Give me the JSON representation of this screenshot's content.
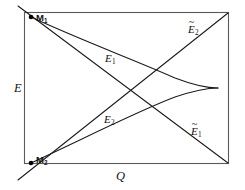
{
  "figure": {
    "kind": "phase-diagram",
    "background_color": "#ffffff",
    "ink_color": "#1a1a1a",
    "frame_color": "#5a5a5a"
  },
  "axes": {
    "y_label": "E",
    "x_label": "Q"
  },
  "nodes": [
    {
      "id": "m1",
      "label_text": "M",
      "label_sub": "1"
    },
    {
      "id": "m2",
      "label_text": "M",
      "label_sub": "2"
    }
  ],
  "curves": [
    {
      "id": "e1",
      "label_text": "E",
      "label_sub": "1",
      "tilde": false
    },
    {
      "id": "e2",
      "label_text": "E",
      "label_sub": "2",
      "tilde": false
    }
  ],
  "lines": [
    {
      "id": "e2_tilde",
      "label_text": "E",
      "label_sub": "2",
      "tilde": true,
      "tilde_glyph": "~"
    },
    {
      "id": "e1_tilde",
      "label_text": "E",
      "label_sub": "1",
      "tilde": true,
      "tilde_glyph": "~"
    }
  ]
}
